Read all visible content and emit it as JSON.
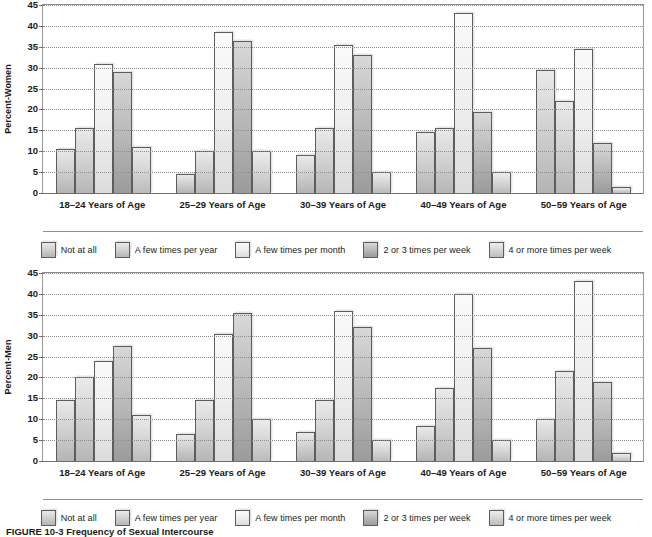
{
  "figure": {
    "caption_label": "FIGURE 10-3",
    "caption_title": "Frequency of Sexual Intercourse"
  },
  "legend": {
    "items": [
      {
        "label": "Not at all",
        "swatch": "c0"
      },
      {
        "label": "A few times per year",
        "swatch": "c1"
      },
      {
        "label": "A few times per month",
        "swatch": "c2"
      },
      {
        "label": "2 or 3 times per week",
        "swatch": "c3"
      },
      {
        "label": "4 or more times per week",
        "swatch": "c4"
      }
    ]
  },
  "chart_data": [
    {
      "type": "bar",
      "title": "",
      "ylabel": "Percent-Women",
      "xlabel": "",
      "ylim": [
        0,
        45
      ],
      "yticks": [
        0,
        5,
        10,
        15,
        20,
        25,
        30,
        35,
        40,
        45
      ],
      "grid": true,
      "legend_position": "bottom",
      "categories": [
        "18–24 Years of Age",
        "25–29 Years of Age",
        "30–39 Years of Age",
        "40–49 Years of Age",
        "50–59 Years of Age"
      ],
      "series": [
        {
          "name": "Not at all",
          "values": [
            10.5,
            4.5,
            9.0,
            14.5,
            29.5
          ]
        },
        {
          "name": "A few times per year",
          "values": [
            15.5,
            10.0,
            15.5,
            15.5,
            22.0
          ]
        },
        {
          "name": "A few times per month",
          "values": [
            31.0,
            38.5,
            35.5,
            43.0,
            34.5
          ]
        },
        {
          "name": "2 or 3 times per week",
          "values": [
            29.0,
            36.5,
            33.0,
            19.5,
            12.0
          ]
        },
        {
          "name": "4 or more times per week",
          "values": [
            11.0,
            10.0,
            5.0,
            5.0,
            1.5
          ]
        }
      ]
    },
    {
      "type": "bar",
      "title": "",
      "ylabel": "Percent-Men",
      "xlabel": "",
      "ylim": [
        0,
        45
      ],
      "yticks": [
        0,
        5,
        10,
        15,
        20,
        25,
        30,
        35,
        40,
        45
      ],
      "grid": true,
      "legend_position": "bottom",
      "categories": [
        "18–24 Years of Age",
        "25–29 Years of Age",
        "30–39 Years of Age",
        "40–49 Years of Age",
        "50–59 Years of Age"
      ],
      "series": [
        {
          "name": "Not at all",
          "values": [
            14.5,
            6.5,
            7.0,
            8.5,
            10.0
          ]
        },
        {
          "name": "A few times per year",
          "values": [
            20.0,
            14.5,
            14.5,
            17.5,
            21.5
          ]
        },
        {
          "name": "A few times per month",
          "values": [
            24.0,
            30.5,
            36.0,
            40.0,
            43.0
          ]
        },
        {
          "name": "2 or 3 times per week",
          "values": [
            27.5,
            35.5,
            32.0,
            27.0,
            19.0
          ]
        },
        {
          "name": "4 or more times per week",
          "values": [
            11.0,
            10.0,
            5.0,
            5.0,
            2.0
          ]
        }
      ]
    }
  ]
}
